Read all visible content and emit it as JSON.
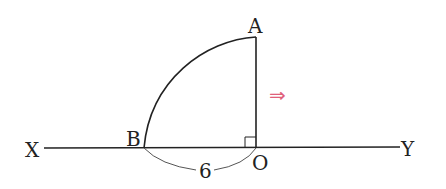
{
  "diagram": {
    "labels": {
      "A": "A",
      "B": "B",
      "O": "O",
      "X": "X",
      "Y": "Y",
      "length": "6"
    },
    "arrow": {
      "glyph": "⇒",
      "color": "#e0607a"
    },
    "colors": {
      "line": "#222222",
      "measure_arc": "#555555"
    }
  }
}
